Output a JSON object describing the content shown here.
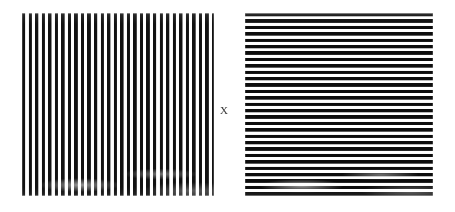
{
  "figure": {
    "background_color": "#ffffff",
    "stripe_color": "#111111",
    "width_px": 455,
    "height_px": 212
  },
  "panels": {
    "left": {
      "name": "vertical-grating",
      "orientation": "vertical",
      "orientation_label": "vertical",
      "stripe_count": 29,
      "stripe_period_px": 6.55,
      "stripe_width_px": 3.2,
      "x_px": 22,
      "y_px": 13,
      "width_px": 192,
      "height_px": 183,
      "stripe_color": "#111111",
      "gap_color": "#ffffff"
    },
    "right": {
      "name": "horizontal-grating",
      "orientation": "horizontal",
      "orientation_label": "horizontal",
      "stripe_count": 29,
      "stripe_period_px": 6.4,
      "stripe_width_px": 3.3,
      "x_px": 245,
      "y_px": 13,
      "width_px": 188,
      "height_px": 184,
      "stripe_color": "#0d0d0d",
      "gap_color": "#ffffff"
    }
  },
  "center_label": {
    "name": "multiplication-symbol",
    "text": "X",
    "x_px": 224,
    "y_px": 111,
    "color": "#3a3a3a",
    "font_size_px": 11
  }
}
